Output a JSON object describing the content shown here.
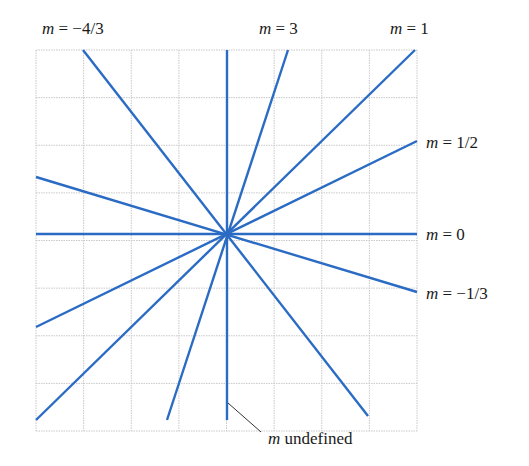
{
  "figure": {
    "type": "slope-lines-through-origin",
    "grid": {
      "cells": 8,
      "left": 36,
      "top": 50,
      "size": 381,
      "color": "#c8c8c8"
    },
    "origin": {
      "x": 227,
      "y": 234
    },
    "line_color": "#2a6bc4",
    "lines": [
      {
        "slope_label": "m undefined",
        "x1": 227,
        "y1": 50,
        "x2": 227,
        "y2": 420
      },
      {
        "slope_label": "m = 0",
        "x1": 36,
        "y1": 234,
        "x2": 417,
        "y2": 234
      },
      {
        "slope_label": "m = −4/3",
        "x1": 83,
        "y1": 50,
        "x2": 368,
        "y2": 416
      },
      {
        "slope_label": "m = 3",
        "x1": 288,
        "y1": 50,
        "x2": 167,
        "y2": 420
      },
      {
        "slope_label": "m = 1",
        "x1": 415,
        "y1": 50,
        "x2": 36,
        "y2": 420
      },
      {
        "slope_label": "m = 1/2",
        "x1": 417,
        "y1": 141,
        "x2": 36,
        "y2": 327
      },
      {
        "slope_label": "m = −1/3",
        "x1": 417,
        "y1": 292,
        "x2": 36,
        "y2": 177
      }
    ]
  },
  "labels": {
    "m_neg4_3": {
      "var": "m",
      "rest": " = −4/3"
    },
    "m_3": {
      "var": "m",
      "rest": " = 3"
    },
    "m_1": {
      "var": "m",
      "rest": " = 1"
    },
    "m_1_2": {
      "var": "m",
      "rest": " = 1/2"
    },
    "m_0": {
      "var": "m",
      "rest": " = 0"
    },
    "m_neg1_3": {
      "var": "m",
      "rest": " = −1/3"
    },
    "m_undef": {
      "var": "m",
      "rest": " undefined"
    }
  }
}
